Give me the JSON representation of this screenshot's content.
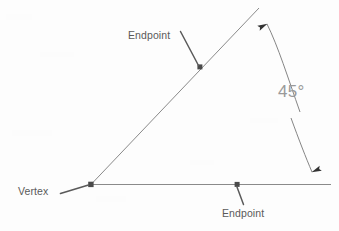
{
  "diagram": {
    "type": "geometry-angle-diagram",
    "background_color": "#fdfdfd",
    "line_color": "#8a8a8a",
    "marker_color": "#5a5a5a",
    "label_color": "#5a5a5a",
    "angle_label_color": "#9a9a9a",
    "labels": {
      "endpoint_top": "Endpoint",
      "endpoint_bottom": "Endpoint",
      "vertex": "Vertex",
      "angle_measure": "45°"
    },
    "geometry": {
      "vertex_point": {
        "x": 91,
        "y": 184
      },
      "ray_horizontal_end": {
        "x": 331,
        "y": 184
      },
      "ray_diagonal_end": {
        "x": 259,
        "y": 8
      },
      "endpoint_marker_diagonal": {
        "x": 200,
        "y": 67
      },
      "endpoint_marker_horizontal": {
        "x": 237,
        "y": 184
      },
      "angle_degrees": 45,
      "arc_upper_start": {
        "x": 310,
        "y": 150
      },
      "arc_lower_end": {
        "x": 266,
        "y": 22
      }
    },
    "leaders": {
      "endpoint_top": {
        "from_x": 180,
        "from_y": 32,
        "to_x": 199,
        "to_y": 66
      },
      "endpoint_bottom": {
        "from_x": 243,
        "from_y": 205,
        "to_x": 237,
        "to_y": 186
      },
      "vertex": {
        "from_x": 60,
        "from_y": 193,
        "to_x": 89,
        "to_y": 185
      }
    }
  }
}
